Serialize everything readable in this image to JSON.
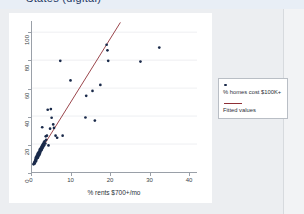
{
  "slide": {
    "cut_title": "States (digital)"
  },
  "legend": {
    "entries": [
      {
        "label": "% homes cost $100K+",
        "marker": "scatter-dot",
        "color": "#1a2a4a"
      },
      {
        "label": "Fitted values",
        "marker": "line",
        "color": "#8f2f36"
      }
    ]
  },
  "chart_data": {
    "type": "scatter",
    "title": "",
    "xlabel": "% rents $700+/mo",
    "ylabel": "",
    "xlim": [
      0,
      42
    ],
    "ylim": [
      0,
      108
    ],
    "xticks": [
      0,
      10,
      20,
      30,
      40
    ],
    "yticks": [
      0,
      20,
      40,
      60,
      80,
      100
    ],
    "xtick_labels": [
      "0",
      "10",
      "20",
      "30",
      "40"
    ],
    "ytick_labels": [
      "0",
      "20",
      "40",
      "60",
      "80",
      "100"
    ],
    "grid": "horizontal",
    "legend_position": "right-outside",
    "series": [
      {
        "name": "% homes cost $100K+",
        "type": "scatter",
        "color": "#1a2a4a",
        "points": [
          [
            0.4,
            5.5
          ],
          [
            0.5,
            6.2
          ],
          [
            0.6,
            7.0
          ],
          [
            0.7,
            6.0
          ],
          [
            0.8,
            8.0
          ],
          [
            0.9,
            9.2
          ],
          [
            1.0,
            7.5
          ],
          [
            1.0,
            10.5
          ],
          [
            1.1,
            8.6
          ],
          [
            1.2,
            11.5
          ],
          [
            1.3,
            9.8
          ],
          [
            1.4,
            12.5
          ],
          [
            1.5,
            10.2
          ],
          [
            1.5,
            13.4
          ],
          [
            1.6,
            11.0
          ],
          [
            1.7,
            14.2
          ],
          [
            1.8,
            12.0
          ],
          [
            1.9,
            15.0
          ],
          [
            2.0,
            13.0
          ],
          [
            2.0,
            16.2
          ],
          [
            2.1,
            14.0
          ],
          [
            2.2,
            17.0
          ],
          [
            2.3,
            15.2
          ],
          [
            2.4,
            18.0
          ],
          [
            2.5,
            16.0
          ],
          [
            2.6,
            19.0
          ],
          [
            2.7,
            17.2
          ],
          [
            2.8,
            20.0
          ],
          [
            2.9,
            18.2
          ],
          [
            3.0,
            21.0
          ],
          [
            3.1,
            19.2
          ],
          [
            3.2,
            22.0
          ],
          [
            2.6,
            32.0
          ],
          [
            3.4,
            20.4
          ],
          [
            3.5,
            25.5
          ],
          [
            3.6,
            23.0
          ],
          [
            3.8,
            26.0
          ],
          [
            4.0,
            44.5
          ],
          [
            4.2,
            19.0
          ],
          [
            4.6,
            31.0
          ],
          [
            4.8,
            45.0
          ],
          [
            5.0,
            38.8
          ],
          [
            5.4,
            34.0
          ],
          [
            5.6,
            31.5
          ],
          [
            6.0,
            26.0
          ],
          [
            6.4,
            24.5
          ],
          [
            7.2,
            79.5
          ],
          [
            7.8,
            26.0
          ],
          [
            9.8,
            65.5
          ],
          [
            13.6,
            39.0
          ],
          [
            13.8,
            54.5
          ],
          [
            15.4,
            58.0
          ],
          [
            16.0,
            36.8
          ],
          [
            17.4,
            62.3
          ],
          [
            19.0,
            91.0
          ],
          [
            19.2,
            87.0
          ],
          [
            19.4,
            79.5
          ],
          [
            27.6,
            79.0
          ],
          [
            32.4,
            89.0
          ]
        ]
      },
      {
        "name": "Fitted values",
        "type": "line",
        "color": "#8f2f36",
        "line_endpoints": [
          [
            1.0,
            10.0
          ],
          [
            22.5,
            107.0
          ]
        ],
        "slope": 4.51,
        "intercept": 5.5
      }
    ]
  }
}
